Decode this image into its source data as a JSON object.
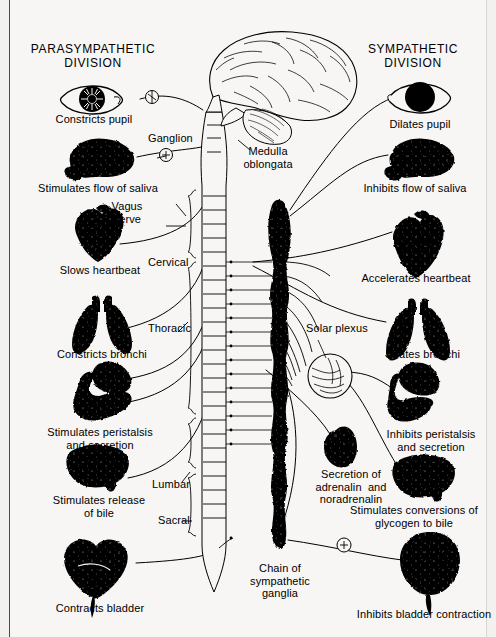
{
  "figure": {
    "background_color": "#f2f1ef",
    "ink_color": "#000000"
  },
  "headers": {
    "left": "PARASYMPATHETIC\nDIVISION",
    "right": "SYMPATHETIC\nDIVISION"
  },
  "central": {
    "brain": "brain",
    "cerebellum": "cerebellum",
    "medulla": "Medulla\noblongata",
    "spinal_cord": "spinal-cord",
    "chain": "Chain of\nsympathetic\nganglia",
    "solar_plexus": "Solar plexus",
    "ganglion": "Ganglion",
    "vagus": "Vagus\nnerve"
  },
  "spine_regions": [
    {
      "label": "Cervical"
    },
    {
      "label": "Thoracic"
    },
    {
      "label": "Lumbar"
    },
    {
      "label": "Sacral"
    }
  ],
  "parasympathetic": [
    {
      "organ": "eye",
      "label": "Constricts pupil"
    },
    {
      "organ": "salivary-gland",
      "label": "Stimulates flow of saliva"
    },
    {
      "organ": "heart",
      "label": "Slows heartbeat"
    },
    {
      "organ": "lungs",
      "label": "Constricts bronchi"
    },
    {
      "organ": "stomach-intestine",
      "label": "Stimulates peristalsis\nand secretion"
    },
    {
      "organ": "liver",
      "label": "Stimulates release\nof bile"
    },
    {
      "organ": "bladder",
      "label": "Contracts bladder"
    }
  ],
  "sympathetic": [
    {
      "organ": "eye",
      "label": "Dilates pupil"
    },
    {
      "organ": "salivary-gland",
      "label": "Inhibits flow of saliva"
    },
    {
      "organ": "heart",
      "label": "Accelerates heartbeat"
    },
    {
      "organ": "lungs",
      "label": "Dilates bronchi"
    },
    {
      "organ": "stomach-intestine",
      "label": "Inhibits peristalsis\nand secretion"
    },
    {
      "organ": "adrenal-gland",
      "label": "Secretion of\nadrenalin  and\nnoradrenalin"
    },
    {
      "organ": "liver",
      "label": "Stimulates conversions of\nglycogen to bile"
    },
    {
      "organ": "bladder",
      "label": "Inhibits bladder contraction"
    }
  ]
}
